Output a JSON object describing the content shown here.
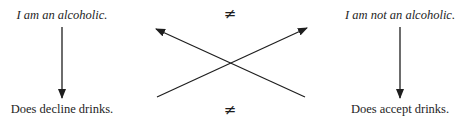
{
  "diagram": {
    "left_column": {
      "belief": "I am an alcoholic.",
      "behavior": "Does decline drinks."
    },
    "right_column": {
      "belief": "I am not an alcoholic.",
      "behavior": "Does accept drinks."
    },
    "inequality_top": "≠",
    "inequality_bottom": "≠",
    "colors": {
      "ink": "#1e1e1e",
      "background": "#ffffff"
    }
  }
}
